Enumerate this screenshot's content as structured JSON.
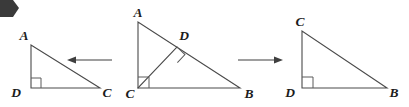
{
  "figure": {
    "stroke_color": "#4a4a4a",
    "label_color": "#1c1c1c",
    "background_color": "#ffffff",
    "corner_marker": {
      "name": "page-corner-marker",
      "color": "#3a3a3a"
    },
    "triangles": [
      {
        "id": "left",
        "name": "triangle-ADC",
        "labels": {
          "apex": "A",
          "right_angle_vertex": "D",
          "base_end": "C"
        },
        "vertices": {
          "A": [
            31,
            45
          ],
          "D": [
            31,
            88
          ],
          "C": [
            100,
            88
          ]
        },
        "right_angle_at": "D"
      },
      {
        "id": "middle",
        "name": "triangle-ACB",
        "labels": {
          "apex": "A",
          "right_angle_vertex": "C",
          "base_end": "B",
          "foot_of_altitude": "D"
        },
        "vertices": {
          "A": [
            138,
            22
          ],
          "C": [
            138,
            88
          ],
          "B": [
            240,
            88
          ],
          "D": [
            177,
            47
          ]
        },
        "right_angle_at": "C",
        "altitude": {
          "from": "C",
          "to": "D",
          "right_angle_at": "D"
        }
      },
      {
        "id": "right",
        "name": "triangle-CDB",
        "labels": {
          "apex": "C",
          "right_angle_vertex": "D",
          "base_end": "B"
        },
        "vertices": {
          "C": [
            302,
            31
          ],
          "D": [
            302,
            88
          ],
          "B": [
            387,
            88
          ]
        },
        "right_angle_at": "D"
      }
    ],
    "arrows": [
      {
        "id": "left-arrow",
        "name": "arrow-left",
        "direction": "left",
        "from": [
          112,
          60
        ],
        "to": [
          68,
          60
        ]
      },
      {
        "id": "right-arrow",
        "name": "arrow-right",
        "direction": "right",
        "from": [
          238,
          60
        ],
        "to": [
          282,
          60
        ]
      }
    ],
    "label_positions": {
      "left_A": [
        24,
        40
      ],
      "left_D": [
        16,
        97
      ],
      "left_C": [
        103,
        97
      ],
      "mid_A": [
        131,
        17
      ],
      "mid_D": [
        178,
        40
      ],
      "mid_C": [
        126,
        97
      ],
      "mid_B": [
        243,
        97
      ],
      "right_C": [
        295,
        26
      ],
      "right_D": [
        287,
        97
      ],
      "right_B": [
        390,
        97
      ]
    }
  }
}
